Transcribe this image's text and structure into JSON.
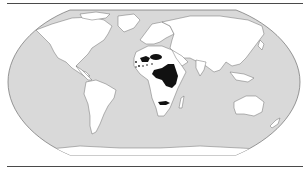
{
  "map": {
    "projection": "robinson",
    "colors": {
      "ocean": "#d9d9d9",
      "land": "#ffffff",
      "coastline": "#6e6e6e",
      "highlight": "#111111",
      "rule": "#4a4a4a"
    },
    "highlighted_regions": [
      "West Africa (Sahel patches)",
      "Central Africa",
      "East Africa",
      "Southern Africa (Zambia / Zimbabwe band)"
    ]
  }
}
